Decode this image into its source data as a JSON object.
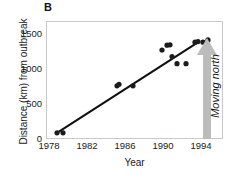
{
  "figure": {
    "panel_label": "B",
    "annotation": {
      "text": "Moving north",
      "icon": "up-arrow-icon",
      "color": "#b8b8b8"
    }
  },
  "chart_data": {
    "type": "scatter",
    "title": "B",
    "xlabel": "Year",
    "ylabel": "Distance (km) from outbreak",
    "xlim": [
      1978,
      1995.5
    ],
    "ylim": [
      -80,
      1700
    ],
    "xticks": [
      1978,
      1982,
      1986,
      1990,
      1994
    ],
    "xtick_labels": [
      "1978",
      "1982",
      "1986",
      "1990",
      "1994"
    ],
    "yticks": [
      0,
      500,
      1000,
      1500
    ],
    "ytick_labels": [
      "0",
      "500",
      "1000",
      "1500"
    ],
    "grid": false,
    "legend": null,
    "marker_color": "#1c1c1c",
    "line_color": "#111111",
    "points": [
      {
        "x": 1979.0,
        "y": 0
      },
      {
        "x": 1979.6,
        "y": 0
      },
      {
        "x": 1985.0,
        "y": 720
      },
      {
        "x": 1985.2,
        "y": 745
      },
      {
        "x": 1986.6,
        "y": 720
      },
      {
        "x": 1989.5,
        "y": 1270
      },
      {
        "x": 1990.0,
        "y": 1345
      },
      {
        "x": 1990.3,
        "y": 1350
      },
      {
        "x": 1990.5,
        "y": 1170
      },
      {
        "x": 1991.0,
        "y": 1060
      },
      {
        "x": 1991.9,
        "y": 1060
      },
      {
        "x": 1992.8,
        "y": 1390
      },
      {
        "x": 1993.1,
        "y": 1400
      },
      {
        "x": 1993.6,
        "y": 1390
      },
      {
        "x": 1994.1,
        "y": 1425
      }
    ],
    "trendline": {
      "type": "linear",
      "x_start": 1979.0,
      "y_start": 0,
      "x_end": 1993.2,
      "y_end": 1400
    },
    "annotations": [
      {
        "text": "Moving north",
        "x": 1994.8,
        "rotation": -90,
        "arrow": "up"
      }
    ]
  }
}
